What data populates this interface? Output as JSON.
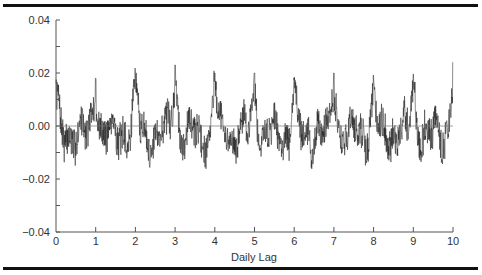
{
  "chart_data": {
    "type": "line",
    "title": "",
    "xlabel": "Daily Lag",
    "ylabel": "",
    "xlim": [
      0,
      10
    ],
    "ylim": [
      -0.04,
      0.04
    ],
    "x_ticks": [
      "0",
      "1",
      "2",
      "3",
      "4",
      "5",
      "6",
      "7",
      "8",
      "9",
      "10"
    ],
    "y_ticks": [
      "0.04",
      "0.02",
      "0.00",
      "−0.02",
      "−0.04"
    ],
    "y_minor_step": 0.01,
    "grid": false,
    "reference_line_y": 0.0,
    "series": [
      {
        "name": "autocorrelation",
        "description": "Dense noisy series with periodic peaks at each integer daily lag",
        "peaks": [
          {
            "x": 0,
            "y": 0.012
          },
          {
            "x": 1,
            "y": 0.018
          },
          {
            "x": 2,
            "y": 0.018
          },
          {
            "x": 3,
            "y": 0.023
          },
          {
            "x": 4,
            "y": 0.02
          },
          {
            "x": 5,
            "y": 0.02
          },
          {
            "x": 6,
            "y": 0.016
          },
          {
            "x": 7,
            "y": 0.02
          },
          {
            "x": 8,
            "y": 0.016
          },
          {
            "x": 9,
            "y": 0.018
          },
          {
            "x": 10,
            "y": 0.024
          }
        ],
        "typical_range": [
          -0.012,
          0.008
        ],
        "min_approx": -0.016
      }
    ]
  },
  "render": {
    "samples": 1400,
    "seed": 7,
    "noise_amp": 0.0055,
    "baseline": -0.003,
    "peak_width": 0.09,
    "line_color": "#1a1a1a"
  }
}
